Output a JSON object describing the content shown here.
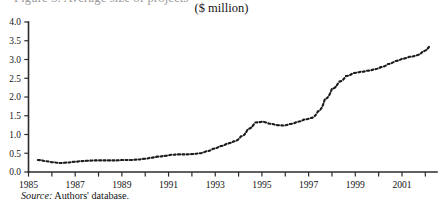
{
  "figure": {
    "title_cutoff": "Figure 3. Average size of projects",
    "subtitle": "($ million)",
    "source_prefix": "Source:",
    "source_text": " Authors' database."
  },
  "chart_data": {
    "type": "line",
    "title": "($ million)",
    "subtitle": "($ million)",
    "xlabel": "",
    "ylabel": "",
    "ylim": [
      0.0,
      4.0
    ],
    "xlim": [
      1985,
      2002.5
    ],
    "grid": false,
    "legend": null,
    "line_style": "dotted",
    "line_color": "#1b1b1b",
    "ytick_labels": [
      "0.0",
      "0.5",
      "1.0",
      "1.5",
      "2.0",
      "2.5",
      "3.0",
      "3.5",
      "4.0"
    ],
    "ytick_values": [
      0.0,
      0.5,
      1.0,
      1.5,
      2.0,
      2.5,
      3.0,
      3.5,
      4.0
    ],
    "xtick_labels": [
      "1985",
      "1987",
      "1989",
      "1991",
      "1993",
      "1995",
      "1997",
      "1999",
      "2001"
    ],
    "xtick_values": [
      1985,
      1987,
      1989,
      1991,
      1993,
      1995,
      1997,
      1999,
      2001
    ],
    "xtick_minor_values": [
      1986,
      1988,
      1990,
      1992,
      1994,
      1996,
      1998,
      2000,
      2002
    ],
    "series": [
      {
        "name": "Average size of projects",
        "x": [
          1985.4,
          1985.7,
          1986.0,
          1986.3,
          1986.6,
          1986.9,
          1987.2,
          1987.5,
          1987.8,
          1988.1,
          1988.4,
          1988.7,
          1989.0,
          1989.3,
          1989.6,
          1989.9,
          1990.2,
          1990.5,
          1990.8,
          1991.1,
          1991.4,
          1991.7,
          1992.0,
          1992.3,
          1992.6,
          1992.9,
          1993.2,
          1993.5,
          1993.8,
          1994.1,
          1994.4,
          1994.7,
          1995.0,
          1995.3,
          1995.6,
          1995.9,
          1996.2,
          1996.5,
          1996.8,
          1997.1,
          1997.4,
          1997.7,
          1998.0,
          1998.3,
          1998.6,
          1998.9,
          1999.2,
          1999.5,
          1999.8,
          2000.1,
          2000.4,
          2000.7,
          2001.0,
          2001.3,
          2001.6,
          2001.9,
          2002.2
        ],
        "values": [
          0.32,
          0.29,
          0.26,
          0.24,
          0.25,
          0.27,
          0.29,
          0.3,
          0.31,
          0.31,
          0.31,
          0.31,
          0.32,
          0.32,
          0.33,
          0.35,
          0.38,
          0.41,
          0.43,
          0.46,
          0.47,
          0.47,
          0.48,
          0.5,
          0.55,
          0.62,
          0.69,
          0.76,
          0.82,
          0.95,
          1.15,
          1.32,
          1.34,
          1.29,
          1.25,
          1.24,
          1.28,
          1.34,
          1.4,
          1.44,
          1.62,
          1.95,
          2.22,
          2.41,
          2.56,
          2.64,
          2.67,
          2.7,
          2.74,
          2.8,
          2.88,
          2.96,
          3.02,
          3.07,
          3.11,
          3.22,
          3.38
        ]
      }
    ]
  }
}
